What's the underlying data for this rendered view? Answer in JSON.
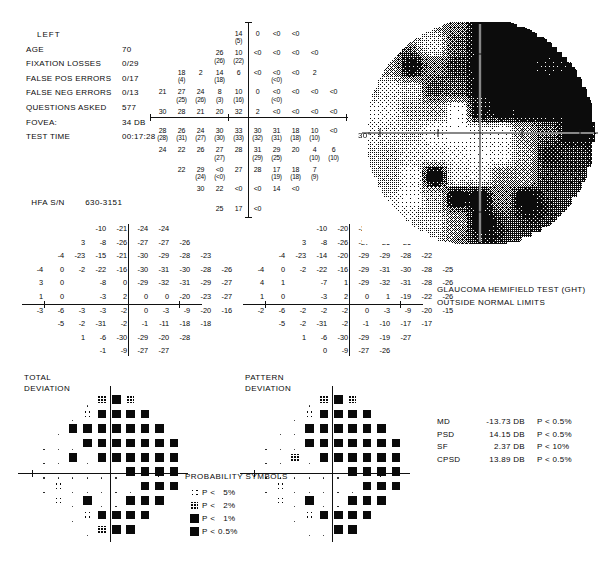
{
  "header": {
    "eye": "LEFT",
    "rows": [
      {
        "label": "AGE",
        "value": "70"
      },
      {
        "label": "FIXATION LOSSES",
        "value": "0/29"
      },
      {
        "label": "FALSE POS ERRORS",
        "value": "0/17"
      },
      {
        "label": "FALSE NEG ERRORS",
        "value": "0/13"
      },
      {
        "label": "QUESTIONS ASKED",
        "value": "577"
      },
      {
        "label": "FOVEA:",
        "value": "34 DB"
      },
      {
        "label": "TEST TIME",
        "value": "00:17:28"
      }
    ],
    "serial_label": "HFA S/N",
    "serial_value": "630-3151"
  },
  "threshold_plot": {
    "name": "numeric-sensitivity-plot",
    "axis_degree_label": "30°",
    "cells": [
      {
        "col": 4,
        "row": 0,
        "v": "14",
        "r": "(5)"
      },
      {
        "col": 5,
        "row": 0,
        "v": "0",
        "r": ""
      },
      {
        "col": 6,
        "row": 0,
        "v": "<0",
        "r": ""
      },
      {
        "col": 7,
        "row": 0,
        "v": "<0",
        "r": ""
      },
      {
        "col": 3,
        "row": 1,
        "v": "26",
        "r": "(26)"
      },
      {
        "col": 4,
        "row": 1,
        "v": "10",
        "r": "(22)"
      },
      {
        "col": 5,
        "row": 1,
        "v": "<0",
        "r": ""
      },
      {
        "col": 6,
        "row": 1,
        "v": "<0",
        "r": ""
      },
      {
        "col": 7,
        "row": 1,
        "v": "<0",
        "r": ""
      },
      {
        "col": 8,
        "row": 1,
        "v": "<0",
        "r": ""
      },
      {
        "col": 1,
        "row": 2,
        "v": "18",
        "r": "(4)"
      },
      {
        "col": 2,
        "row": 2,
        "v": "2",
        "r": ""
      },
      {
        "col": 3,
        "row": 2,
        "v": "14",
        "r": "(18)"
      },
      {
        "col": 4,
        "row": 2,
        "v": "6",
        "r": ""
      },
      {
        "col": 5,
        "row": 2,
        "v": "<0",
        "r": ""
      },
      {
        "col": 6,
        "row": 2,
        "v": "<0",
        "r": "(<0)"
      },
      {
        "col": 7,
        "row": 2,
        "v": "<0",
        "r": ""
      },
      {
        "col": 8,
        "row": 2,
        "v": "2",
        "r": ""
      },
      {
        "col": 0,
        "row": 3,
        "v": "21",
        "r": ""
      },
      {
        "col": 1,
        "row": 3,
        "v": "27",
        "r": "(25)"
      },
      {
        "col": 2,
        "row": 3,
        "v": "24",
        "r": "(26)"
      },
      {
        "col": 3,
        "row": 3,
        "v": "8",
        "r": "(3)"
      },
      {
        "col": 4,
        "row": 3,
        "v": "10",
        "r": "(16)"
      },
      {
        "col": 5,
        "row": 3,
        "v": "0",
        "r": ""
      },
      {
        "col": 6,
        "row": 3,
        "v": "<0",
        "r": "(<0)"
      },
      {
        "col": 7,
        "row": 3,
        "v": "<0",
        "r": ""
      },
      {
        "col": 8,
        "row": 3,
        "v": "<0",
        "r": ""
      },
      {
        "col": 9,
        "row": 3,
        "v": "<0",
        "r": ""
      },
      {
        "col": 0,
        "row": 4,
        "v": "30",
        "r": ""
      },
      {
        "col": 1,
        "row": 4,
        "v": "28",
        "r": ""
      },
      {
        "col": 2,
        "row": 4,
        "v": "21",
        "r": ""
      },
      {
        "col": 3,
        "row": 4,
        "v": "20",
        "r": ""
      },
      {
        "col": 4,
        "row": 4,
        "v": "32",
        "r": ""
      },
      {
        "col": 5,
        "row": 4,
        "v": "2",
        "r": ""
      },
      {
        "col": 6,
        "row": 4,
        "v": "<0",
        "r": ""
      },
      {
        "col": 7,
        "row": 4,
        "v": "<0",
        "r": ""
      },
      {
        "col": 8,
        "row": 4,
        "v": "<0",
        "r": ""
      },
      {
        "col": 9,
        "row": 4,
        "v": "<0",
        "r": ""
      },
      {
        "col": 0,
        "row": 5,
        "v": "28",
        "r": "(28)"
      },
      {
        "col": 1,
        "row": 5,
        "v": "26",
        "r": "(31)"
      },
      {
        "col": 2,
        "row": 5,
        "v": "24",
        "r": "(27)"
      },
      {
        "col": 3,
        "row": 5,
        "v": "30",
        "r": "(30)"
      },
      {
        "col": 4,
        "row": 5,
        "v": "33",
        "r": "(33)"
      },
      {
        "col": 5,
        "row": 5,
        "v": "30",
        "r": "(32)"
      },
      {
        "col": 6,
        "row": 5,
        "v": "31",
        "r": "(31)"
      },
      {
        "col": 7,
        "row": 5,
        "v": "18",
        "r": "(18)"
      },
      {
        "col": 8,
        "row": 5,
        "v": "10",
        "r": "(10)"
      },
      {
        "col": 9,
        "row": 5,
        "v": "<0",
        "r": ""
      },
      {
        "col": 0,
        "row": 6,
        "v": "24",
        "r": ""
      },
      {
        "col": 1,
        "row": 6,
        "v": "22",
        "r": ""
      },
      {
        "col": 2,
        "row": 6,
        "v": "26",
        "r": ""
      },
      {
        "col": 3,
        "row": 6,
        "v": "27",
        "r": "(27)"
      },
      {
        "col": 4,
        "row": 6,
        "v": "28",
        "r": ""
      },
      {
        "col": 5,
        "row": 6,
        "v": "31",
        "r": "(29)"
      },
      {
        "col": 6,
        "row": 6,
        "v": "29",
        "r": "(25)"
      },
      {
        "col": 7,
        "row": 6,
        "v": "20",
        "r": ""
      },
      {
        "col": 8,
        "row": 6,
        "v": "4",
        "r": "(10)"
      },
      {
        "col": 9,
        "row": 6,
        "v": "6",
        "r": "(10)"
      },
      {
        "col": 1,
        "row": 7,
        "v": "22",
        "r": ""
      },
      {
        "col": 2,
        "row": 7,
        "v": "29",
        "r": "(24)"
      },
      {
        "col": 3,
        "row": 7,
        "v": "<0",
        "r": "(<0)"
      },
      {
        "col": 4,
        "row": 7,
        "v": "27",
        "r": ""
      },
      {
        "col": 5,
        "row": 7,
        "v": "28",
        "r": ""
      },
      {
        "col": 6,
        "row": 7,
        "v": "17",
        "r": "(19)"
      },
      {
        "col": 7,
        "row": 7,
        "v": "18",
        "r": "(18)"
      },
      {
        "col": 8,
        "row": 7,
        "v": "7",
        "r": "(9)"
      },
      {
        "col": 2,
        "row": 8,
        "v": "30",
        "r": ""
      },
      {
        "col": 3,
        "row": 8,
        "v": "22",
        "r": ""
      },
      {
        "col": 4,
        "row": 8,
        "v": "<0",
        "r": ""
      },
      {
        "col": 5,
        "row": 8,
        "v": "<0",
        "r": ""
      },
      {
        "col": 6,
        "row": 8,
        "v": "14",
        "r": ""
      },
      {
        "col": 7,
        "row": 8,
        "v": "<0",
        "r": ""
      },
      {
        "col": 3,
        "row": 9,
        "v": "25",
        "r": ""
      },
      {
        "col": 4,
        "row": 9,
        "v": "17",
        "r": ""
      },
      {
        "col": 5,
        "row": 9,
        "v": "<0",
        "r": ""
      }
    ]
  },
  "total_deviation": {
    "title_line1": "TOTAL",
    "title_line2": "DEVIATION",
    "rows": [
      {
        "offset": 4,
        "values": [
          "-10",
          "-21",
          "-24",
          "-24"
        ]
      },
      {
        "offset": 3,
        "values": [
          "3",
          "-8",
          "-26",
          "-27",
          "-27",
          "-26"
        ]
      },
      {
        "offset": 2,
        "values": [
          "-4",
          "-23",
          "-15",
          "-21",
          "-30",
          "-29",
          "-28",
          "-23"
        ]
      },
      {
        "offset": 1,
        "values": [
          "-4",
          "0",
          "-2",
          "-22",
          "-16",
          "-30",
          "-31",
          "-30",
          "-28",
          "-26"
        ]
      },
      {
        "offset": 1,
        "values": [
          "3",
          "0",
          "",
          "-8",
          "0",
          "-29",
          "-32",
          "-31",
          "-29",
          "-27"
        ]
      },
      {
        "offset": 1,
        "values": [
          "1",
          "0",
          "",
          "-3",
          "2",
          "0",
          "0",
          "-20",
          "-23",
          "-27"
        ]
      },
      {
        "offset": 1,
        "values": [
          "-3",
          "-6",
          "-3",
          "-3",
          "-2",
          "0",
          "-3",
          "-9",
          "-20",
          "-16"
        ]
      },
      {
        "offset": 2,
        "values": [
          "-5",
          "-2",
          "-31",
          "-2",
          "-1",
          "-11",
          "-18",
          "-18"
        ]
      },
      {
        "offset": 3,
        "values": [
          "1",
          "-6",
          "-30",
          "-29",
          "-20",
          "-28"
        ]
      },
      {
        "offset": 4,
        "values": [
          "-1",
          "-9",
          "-27",
          "-27"
        ]
      }
    ]
  },
  "pattern_deviation": {
    "title_line1": "PATTERN",
    "title_line2": "DEVIATION",
    "rows": [
      {
        "offset": 4,
        "values": [
          "-10",
          "-20",
          "-24",
          "-23"
        ]
      },
      {
        "offset": 3,
        "values": [
          "3",
          "-8",
          "-26",
          "-27",
          "-26",
          "-26"
        ]
      },
      {
        "offset": 2,
        "values": [
          "-4",
          "-23",
          "-14",
          "-20",
          "-29",
          "-29",
          "-28",
          "-22"
        ]
      },
      {
        "offset": 1,
        "values": [
          "-4",
          "0",
          "-2",
          "-22",
          "-16",
          "-29",
          "-31",
          "-30",
          "-28",
          "-25"
        ]
      },
      {
        "offset": 1,
        "values": [
          "4",
          "1",
          "",
          "-7",
          "1",
          "-29",
          "-32",
          "-31",
          "-28",
          "-26"
        ]
      },
      {
        "offset": 1,
        "values": [
          "1",
          "0",
          "",
          "-3",
          "2",
          "0",
          "1",
          "-19",
          "-22",
          "-26"
        ]
      },
      {
        "offset": 1,
        "values": [
          "-2",
          "-6",
          "-2",
          "-2",
          "-2",
          "0",
          "-3",
          "-9",
          "-20",
          "-15"
        ]
      },
      {
        "offset": 2,
        "values": [
          "-5",
          "-2",
          "-31",
          "-2",
          "-1",
          "-10",
          "-17",
          "-17"
        ]
      },
      {
        "offset": 3,
        "values": [
          "1",
          "-6",
          "-30",
          "-29",
          "-19",
          "-27"
        ]
      },
      {
        "offset": 4,
        "values": [
          "0",
          "-9",
          "-27",
          "-26"
        ]
      }
    ]
  },
  "total_deviation_probability": {
    "name": "total-deviation-probability-plot",
    "rows": [
      {
        "offset": 4,
        "syms": [
          "n",
          "2",
          "1",
          "2"
        ]
      },
      {
        "offset": 3,
        "syms": [
          "n",
          "5",
          "b",
          "b",
          "b",
          "b"
        ]
      },
      {
        "offset": 2,
        "syms": [
          "n",
          "b",
          "b",
          "b",
          "b",
          "b",
          "b",
          "b"
        ]
      },
      {
        "offset": 1,
        "syms": [
          "n",
          "n",
          "n",
          "b",
          "b",
          "b",
          "b",
          "b",
          "b",
          "b"
        ]
      },
      {
        "offset": 1,
        "syms": [
          "n",
          "n",
          "1",
          "n",
          "b",
          "b",
          "b",
          "b",
          "b",
          "b"
        ]
      },
      {
        "offset": 1,
        "syms": [
          "n",
          "n",
          "n",
          "n",
          "n",
          "n",
          "b",
          "b",
          "b",
          "b"
        ]
      },
      {
        "offset": 1,
        "syms": [
          "n",
          "5",
          "n",
          "n",
          "n",
          "n",
          "n",
          "b",
          "b",
          "b"
        ]
      },
      {
        "offset": 2,
        "syms": [
          "5",
          "n",
          "b",
          "n",
          "n",
          "b",
          "b",
          "b"
        ]
      },
      {
        "offset": 3,
        "syms": [
          "n",
          "5",
          "b",
          "b",
          "b",
          "b"
        ]
      },
      {
        "offset": 4,
        "syms": [
          "n",
          "2",
          "b",
          "b"
        ]
      }
    ]
  },
  "pattern_deviation_probability": {
    "name": "pattern-deviation-probability-plot",
    "rows": [
      {
        "offset": 4,
        "syms": [
          "n",
          "2",
          "1",
          "2"
        ]
      },
      {
        "offset": 3,
        "syms": [
          "n",
          "5",
          "b",
          "b",
          "b",
          "b"
        ]
      },
      {
        "offset": 2,
        "syms": [
          "n",
          "n",
          "b",
          "b",
          "b",
          "b",
          "b",
          "b"
        ]
      },
      {
        "offset": 1,
        "syms": [
          "n",
          "n",
          "n",
          "b",
          "b",
          "b",
          "b",
          "b",
          "b",
          "b"
        ]
      },
      {
        "offset": 1,
        "syms": [
          "n",
          "n",
          "2",
          "n",
          "b",
          "b",
          "b",
          "b",
          "b",
          "b"
        ]
      },
      {
        "offset": 1,
        "syms": [
          "n",
          "n",
          "n",
          "n",
          "n",
          "n",
          "b",
          "b",
          "b",
          "b"
        ]
      },
      {
        "offset": 1,
        "syms": [
          "n",
          "5",
          "n",
          "n",
          "n",
          "n",
          "n",
          "b",
          "b",
          "b"
        ]
      },
      {
        "offset": 2,
        "syms": [
          "5",
          "n",
          "b",
          "n",
          "n",
          "b",
          "b",
          "b"
        ]
      },
      {
        "offset": 3,
        "syms": [
          "n",
          "5",
          "b",
          "b",
          "b",
          "b"
        ]
      },
      {
        "offset": 4,
        "syms": [
          "n",
          "n",
          "b",
          "b"
        ]
      }
    ]
  },
  "ght": {
    "title": "GLAUCOMA HEMIFIELD TEST (GHT)",
    "result": "OUTSIDE NORMAL LIMITS"
  },
  "indices": [
    {
      "key": "MD",
      "value": "-13.73 DB",
      "p": "P < 0.5%"
    },
    {
      "key": "PSD",
      "value": "14.15 DB",
      "p": "P < 0.5%"
    },
    {
      "key": "SF",
      "value": "2.37 DB",
      "p": "P < 10%"
    },
    {
      "key": "CPSD",
      "value": "13.89 DB",
      "p": "P < 0.5%"
    }
  ],
  "legend": {
    "title": "PROBABILITY SYMBOLS",
    "entries": [
      {
        "symbol": "5",
        "text": "P <   5%"
      },
      {
        "symbol": "2",
        "text": "P <   2%"
      },
      {
        "symbol": "1",
        "text": "P <   1%"
      },
      {
        "symbol": "b",
        "text": "P < 0.5%"
      }
    ]
  },
  "grayscale": {
    "name": "grayscale-sensitivity-map",
    "degree_label": "30°"
  }
}
